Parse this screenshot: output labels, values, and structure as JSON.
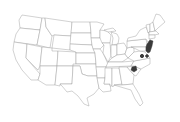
{
  "map": {
    "type": "choropleth",
    "region": "United States (contiguous)",
    "colors": {
      "background": "#ffffff",
      "state_fill": "#ffffff",
      "state_border": "#9a9a9a",
      "highlight": "#3a3a3a"
    },
    "highlighted_areas": [
      {
        "id": "nj-de-md-coast",
        "label": "NJ / DE / MD coastal area"
      },
      {
        "id": "va-1",
        "label": "Virginia point A"
      },
      {
        "id": "va-2",
        "label": "Virginia point B"
      },
      {
        "id": "nc-tn-ga",
        "label": "Western NC / SC / GA area"
      }
    ]
  }
}
